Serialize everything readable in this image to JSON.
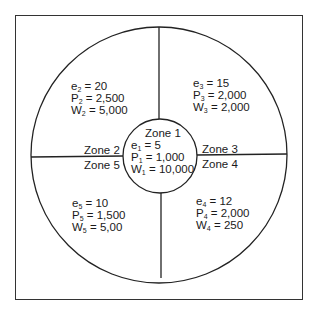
{
  "diagram": {
    "type": "zone-diagram",
    "zones": [
      {
        "id": "zone-1",
        "name": "Zone 1",
        "e": {
          "sym": "e",
          "sub": "1",
          "value": "5"
        },
        "P": {
          "sym": "P",
          "sub": "1",
          "value": "1,000"
        },
        "W": {
          "sym": "W",
          "sub": "1",
          "value": "10,000"
        }
      },
      {
        "id": "zone-2",
        "name": "Zone 2",
        "e": {
          "sym": "e",
          "sub": "2",
          "value": "20"
        },
        "P": {
          "sym": "P",
          "sub": "2",
          "value": "2,500"
        },
        "W": {
          "sym": "W",
          "sub": "2",
          "value": "5,000"
        }
      },
      {
        "id": "zone-3",
        "name": "Zone 3",
        "e": {
          "sym": "e",
          "sub": "3",
          "value": "15"
        },
        "P": {
          "sym": "P",
          "sub": "3",
          "value": "2,000"
        },
        "W": {
          "sym": "W",
          "sub": "3",
          "value": "2,000"
        }
      },
      {
        "id": "zone-4",
        "name": "Zone 4",
        "e": {
          "sym": "e",
          "sub": "4",
          "value": "12"
        },
        "P": {
          "sym": "P",
          "sub": "4",
          "value": "2,000"
        },
        "W": {
          "sym": "W",
          "sub": "4",
          "value": "250"
        }
      },
      {
        "id": "zone-5",
        "name": "Zone 5",
        "e": {
          "sym": "e",
          "sub": "5",
          "value": "10"
        },
        "P": {
          "sym": "P",
          "sub": "5",
          "value": "1,500"
        },
        "W": {
          "sym": "W",
          "sub": "5",
          "value": "5,00"
        }
      }
    ],
    "equals": "="
  }
}
